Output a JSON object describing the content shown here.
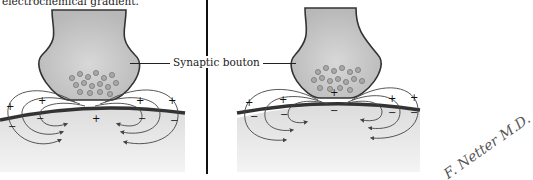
{
  "figure": {
    "caption_fragment": "electrochemical gradient.",
    "label": "Synaptic bouton",
    "signature": "F. Netter M.D.",
    "panels": [
      {
        "name": "left-panel",
        "charges_above": [
          "+",
          "+",
          "+",
          "+"
        ],
        "charges_below": [
          "−",
          "−",
          "−",
          "−"
        ],
        "center_charge": "+"
      },
      {
        "name": "right-panel",
        "charges_above": [
          "+",
          "+",
          "+",
          "+"
        ],
        "charges_below": [
          "−",
          "−",
          "−",
          "−"
        ],
        "center_charge": "−"
      }
    ],
    "colors": {
      "bouton_fill": "#c8c8c8",
      "membrane": "#333333",
      "tissue": "#e4e4e4",
      "line": "#444444"
    }
  }
}
